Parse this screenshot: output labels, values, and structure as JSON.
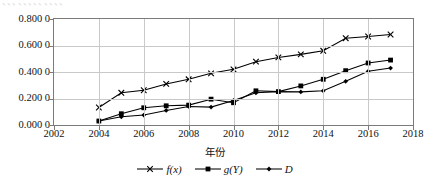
{
  "top_partial_text": "、、、、、、、、、、、、",
  "axis": {
    "x_title": "年份",
    "y_ticks": [
      "0.800 0",
      "0.600 0",
      "0.400 0",
      "0.200 0",
      "0.000 0"
    ],
    "y_tick_values": [
      0.8,
      0.6,
      0.4,
      0.2,
      0.0
    ],
    "x_ticks": [
      "2002",
      "2004",
      "2006",
      "2008",
      "2010",
      "2012",
      "2014",
      "2016",
      "2018"
    ],
    "x_tick_values": [
      2002,
      2004,
      2006,
      2008,
      2010,
      2012,
      2014,
      2016,
      2018
    ]
  },
  "legend": {
    "position": "bottom-center",
    "items": [
      {
        "label": "f(x)",
        "marker": "cross-marker",
        "color": "#000000"
      },
      {
        "label": "g(Y)",
        "marker": "square-marker",
        "color": "#000000"
      },
      {
        "label": "D",
        "marker": "diamond-marker",
        "color": "#000000"
      }
    ]
  },
  "chart_data": {
    "type": "line",
    "title": "",
    "xlabel": "年份",
    "ylabel": "",
    "xlim": [
      2002,
      2018
    ],
    "ylim": [
      0.0,
      0.8
    ],
    "grid": true,
    "legend_position": "bottom-center",
    "x": [
      2004,
      2005,
      2006,
      2007,
      2008,
      2009,
      2010,
      2011,
      2012,
      2013,
      2014,
      2015,
      2016,
      2017
    ],
    "series": [
      {
        "name": "f(x)",
        "marker": "cross-marker",
        "values": [
          0.132,
          0.243,
          0.262,
          0.31,
          0.345,
          0.39,
          0.42,
          0.478,
          0.51,
          0.533,
          0.56,
          0.655,
          0.668,
          0.683
        ]
      },
      {
        "name": "g(Y)",
        "marker": "square-marker",
        "values": [
          0.03,
          0.085,
          0.13,
          0.145,
          0.15,
          0.195,
          0.168,
          0.258,
          0.252,
          0.295,
          0.345,
          0.41,
          0.468,
          0.49
        ]
      },
      {
        "name": "D",
        "marker": "diamond-marker",
        "values": [
          0.03,
          0.062,
          0.075,
          0.11,
          0.14,
          0.135,
          0.185,
          0.243,
          0.252,
          0.25,
          0.258,
          0.33,
          0.405,
          0.43
        ]
      }
    ]
  }
}
